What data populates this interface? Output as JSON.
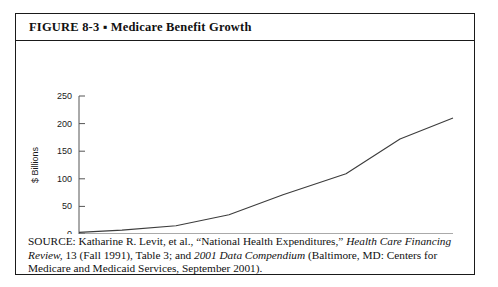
{
  "figure": {
    "label": "FIGURE  8-3",
    "separator": "▪",
    "title": "Medicare Benefit Growth",
    "title_full": "FIGURE  8-3  ▪  Medicare Benefit Growth"
  },
  "source": {
    "line1_a": "SOURCE: Katharine R. Levit, et al., “National Health Expenditures,” ",
    "line1_b": "Health Care Financing",
    "line2_a": "Review,",
    "line2_b": " 13 (Fall 1991), Table 3; and ",
    "line2_c": "2001 Data Compendium",
    "line2_d": " (Baltimore, MD: Centers for",
    "line3": "Medicare and Medicaid Services, September 2001)."
  },
  "chart_data": {
    "type": "line",
    "title": "Medicare Benefit Growth",
    "xlabel": "",
    "ylabel": "$ Billions",
    "xlim": [
      1966,
      2000
    ],
    "ylim": [
      0,
      250
    ],
    "grid": false,
    "legend": null,
    "x_tick_labels": [
      "1966",
      "1970",
      "1975",
      "1980",
      "1985",
      "1990",
      "1995",
      "2000"
    ],
    "x_ticks": [
      1966,
      1970,
      1975,
      1980,
      1985,
      1990,
      1995,
      2000
    ],
    "y_tick_labels": [
      "0",
      "50",
      "100",
      "150",
      "200",
      "250"
    ],
    "y_ticks": [
      0,
      50,
      100,
      150,
      200,
      250
    ],
    "series": [
      {
        "name": "Medicare Benefit Payments",
        "x": [
          1966,
          1970,
          1975,
          1980,
          1985,
          1990,
          1995,
          2000
        ],
        "values": [
          3,
          7,
          15,
          35,
          71,
          109,
          172,
          210
        ]
      }
    ]
  }
}
